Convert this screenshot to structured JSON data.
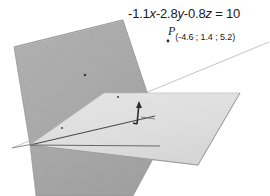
{
  "figure": {
    "title_equation": "-1.1x-2.8y-0.8z = 10",
    "equation_parts": {
      "a": "-1.1",
      "x": "x",
      "b": "-2.8",
      "y": "y",
      "c": "-0.8",
      "z": "z",
      "eq": " = ",
      "d": "10"
    },
    "point": {
      "name": "P",
      "coordinates": "(-4.6 ; 1.4 ; 5.2)",
      "x": "-4.6",
      "y": "1.4",
      "z": "5.2"
    },
    "colors": {
      "background": "#ffffff",
      "plane_back_fill": "#a9a9a9",
      "plane_bottom_fill": "#a5a5a5",
      "plane_front_fill": "#e2e2e2",
      "edge_dark": "#4a4a4a",
      "edge_light": "#bfbfbf",
      "text": "#1a1a1a",
      "vector_color": "#2b2b2b"
    },
    "elements": {
      "back_plane_name": "tilted-plane",
      "front_plane_name": "horizontal-plane",
      "bottom_plane_name": "lower-plane",
      "normal_vector_name": "normal-vector",
      "intersection_line_name": "intersection-line",
      "point_marker_name": "point-p-marker"
    }
  }
}
